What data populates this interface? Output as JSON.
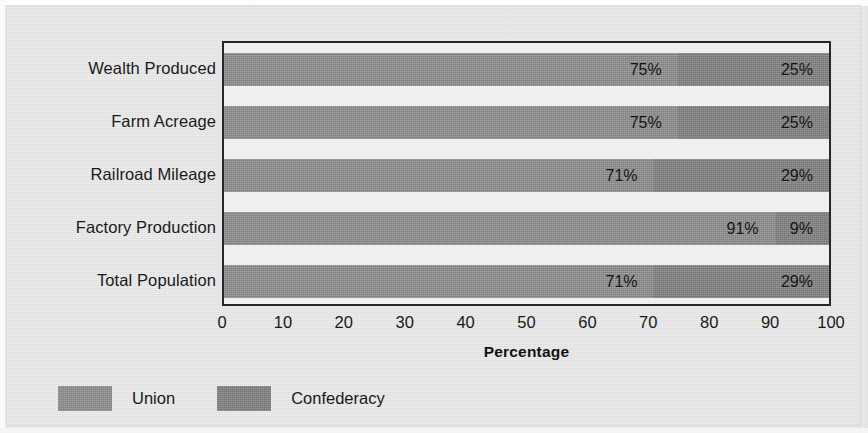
{
  "chart_data": {
    "type": "bar",
    "orientation": "horizontal",
    "stacked": true,
    "stacked_mode": "percent",
    "title": "",
    "xlabel": "Percentage",
    "ylabel": "",
    "xlim": [
      0,
      100
    ],
    "xticks": [
      "0",
      "10",
      "20",
      "30",
      "40",
      "50",
      "60",
      "70",
      "80",
      "90",
      "100"
    ],
    "xtick_values": [
      0,
      10,
      20,
      30,
      40,
      50,
      60,
      70,
      80,
      90,
      100
    ],
    "grid": false,
    "legend_position": "bottom-left",
    "categories": [
      "Wealth Produced",
      "Farm Acreage",
      "Railroad Mileage",
      "Factory Production",
      "Total Population"
    ],
    "series": [
      {
        "name": "Union",
        "color": "#8e8e8e",
        "values": [
          75,
          75,
          71,
          91,
          71
        ],
        "labels": [
          "75%",
          "75%",
          "71%",
          "91%",
          "71%"
        ]
      },
      {
        "name": "Confederacy",
        "color": "#868686",
        "values": [
          25,
          25,
          29,
          9,
          29
        ],
        "labels": [
          "25%",
          "25%",
          "29%",
          "9%",
          "29%"
        ]
      }
    ]
  },
  "legend": {
    "items": [
      {
        "label": "Union",
        "swatch": "union"
      },
      {
        "label": "Confederacy",
        "swatch": "conf"
      }
    ]
  },
  "axis": {
    "x_title": "Percentage"
  }
}
